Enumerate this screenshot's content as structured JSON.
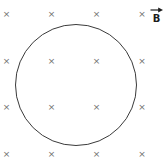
{
  "diagram": {
    "field_label": "B",
    "field_symbol": "×",
    "vector_arrow_icon": "right-arrow",
    "colors": {
      "background": "#ffffff",
      "mark": "#6f6f6f",
      "circle": "#3a3a3a",
      "label": "#1c1c1c"
    },
    "circle": {
      "cx": 75.5,
      "cy": 85,
      "r": 61
    },
    "marks": [
      {
        "x": 6.5,
        "y": 14
      },
      {
        "x": 51.5,
        "y": 14
      },
      {
        "x": 96.5,
        "y": 14
      },
      {
        "x": 142,
        "y": 14
      },
      {
        "x": 6.5,
        "y": 61
      },
      {
        "x": 51.5,
        "y": 61
      },
      {
        "x": 96.5,
        "y": 61
      },
      {
        "x": 142,
        "y": 61
      },
      {
        "x": 6.5,
        "y": 107
      },
      {
        "x": 51.5,
        "y": 107
      },
      {
        "x": 96.5,
        "y": 107
      },
      {
        "x": 142,
        "y": 107
      },
      {
        "x": 6.5,
        "y": 154
      },
      {
        "x": 51.5,
        "y": 154
      },
      {
        "x": 96.5,
        "y": 154
      },
      {
        "x": 142,
        "y": 154
      }
    ],
    "label_position": {
      "left": 150,
      "top": 7
    }
  }
}
